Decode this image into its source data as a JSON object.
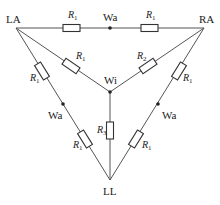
{
  "diagram": {
    "type": "circuit",
    "nodes": {
      "LA": {
        "label": "LA"
      },
      "RA": {
        "label": "RA"
      },
      "LL": {
        "label": "LL"
      },
      "Wi": {
        "label": "Wi"
      },
      "Wa_top": {
        "label": "Wa"
      },
      "Wa_left": {
        "label": "Wa"
      },
      "Wa_right": {
        "label": "Wa"
      }
    },
    "resistors": [
      {
        "id": "r-la-wa-top",
        "symbol": "R",
        "sub": "1"
      },
      {
        "id": "r-wa-top-ra",
        "symbol": "R",
        "sub": "1"
      },
      {
        "id": "r-la-wi",
        "symbol": "R",
        "sub": "1"
      },
      {
        "id": "r-ra-wi",
        "symbol": "R",
        "sub": "2"
      },
      {
        "id": "r-wi-ll",
        "symbol": "R",
        "sub": "3"
      },
      {
        "id": "r-la-wa-left",
        "symbol": "R",
        "sub": "1"
      },
      {
        "id": "r-wa-left-ll",
        "symbol": "R",
        "sub": "1"
      },
      {
        "id": "r-ra-wa-right",
        "symbol": "R",
        "sub": "1"
      },
      {
        "id": "r-wa-right-ll",
        "symbol": "R",
        "sub": "1"
      }
    ]
  }
}
